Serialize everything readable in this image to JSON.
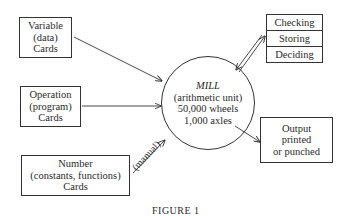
{
  "diagram": {
    "inputs": [
      {
        "id": "variable",
        "lines": [
          "Variable",
          "(data)",
          "Cards"
        ]
      },
      {
        "id": "operation",
        "lines": [
          "Operation",
          "(program)",
          "Cards"
        ]
      },
      {
        "id": "number",
        "lines": [
          "Number",
          "(constants, functions)",
          "Cards"
        ]
      }
    ],
    "mill": {
      "title": "MILL",
      "lines": [
        "(arithmetic unit)",
        "50,000 wheels",
        "1,000 axles"
      ]
    },
    "control": {
      "items": [
        "Checking",
        "Storing",
        "Deciding"
      ]
    },
    "output": {
      "lines": [
        "Output",
        "printed",
        "or punched"
      ]
    },
    "edge_labels": {
      "number_to_mill": "(manual)"
    },
    "caption": "FIGURE 1"
  },
  "colors": {
    "line": "#333333",
    "text": "#2a2a2a",
    "background": "#ffffff"
  }
}
